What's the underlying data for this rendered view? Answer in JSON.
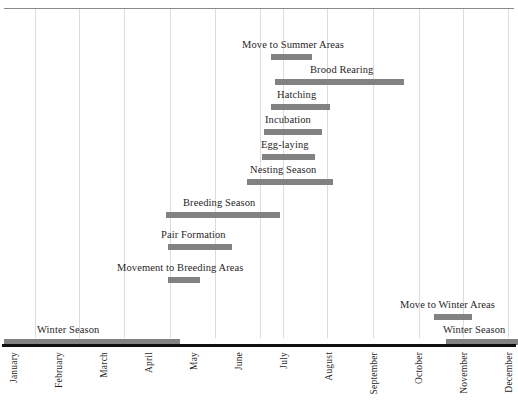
{
  "chart_data": {
    "type": "bar",
    "orientation": "horizontal-gantt",
    "title": "",
    "subtitle": "",
    "xlabel": "",
    "ylabel": "",
    "grid": true,
    "legend": null,
    "xlim": [
      1,
      13
    ],
    "x_unit": "month",
    "categories": [
      "January",
      "February",
      "March",
      "April",
      "May",
      "June",
      "July",
      "August",
      "September",
      "October",
      "November",
      "December"
    ],
    "tick_labels": [
      "January",
      "February",
      "March",
      "April",
      "May",
      "June",
      "July",
      "August",
      "September",
      "October",
      "November",
      "December"
    ],
    "bar_color": "#828282",
    "axis_color": "#101010",
    "grid_color": "#dcdcdc",
    "tasks": [
      {
        "label": "Move to Summer Areas",
        "start_month": 6.7,
        "end_month": 7.7,
        "start_px": 271,
        "end_px": 312,
        "row": 0,
        "label_align": "start-at-bar-start-offset",
        "label_px": 242
      },
      {
        "label": "Brood Rearing",
        "start_month": 6.8,
        "end_month": 9.9,
        "start_px": 275,
        "end_px": 404,
        "row": 1,
        "label_align": "end",
        "label_px": 310
      },
      {
        "label": "Hatching",
        "start_month": 6.7,
        "end_month": 8.1,
        "start_px": 271,
        "end_px": 330,
        "row": 2,
        "label_align": "center",
        "label_px": 277
      },
      {
        "label": "Incubation",
        "start_month": 6.5,
        "end_month": 7.9,
        "start_px": 264,
        "end_px": 322,
        "row": 3,
        "label_align": "center",
        "label_px": 265
      },
      {
        "label": "Egg-laying",
        "start_month": 6.4,
        "end_month": 7.7,
        "start_px": 262,
        "end_px": 315,
        "row": 4,
        "label_align": "center",
        "label_px": 261
      },
      {
        "label": "Nesting Season",
        "start_month": 6.1,
        "end_month": 8.2,
        "start_px": 247,
        "end_px": 333,
        "row": 5,
        "label_align": "center",
        "label_px": 250
      },
      {
        "label": "Breeding Season",
        "start_month": 4.2,
        "end_month": 6.9,
        "start_px": 166,
        "end_px": 280,
        "row": 6,
        "label_align": "center",
        "label_px": 183
      },
      {
        "label": "Pair Formation",
        "start_month": 4.2,
        "end_month": 5.8,
        "start_px": 168,
        "end_px": 232,
        "row": 7,
        "label_align": "center",
        "label_px": 161
      },
      {
        "label": "Movement to Breeding Areas",
        "start_month": 4.2,
        "end_month": 5.0,
        "start_px": 168,
        "end_px": 200,
        "row": 8,
        "label_align": "center",
        "label_px": 117
      },
      {
        "label": "Move to Winter Areas",
        "start_month": 10.6,
        "end_month": 11.5,
        "start_px": 434,
        "end_px": 472,
        "row": 9,
        "label_align": "center",
        "label_px": 400
      },
      {
        "label": "Winter Season",
        "start_month": 10.9,
        "end_month": 13.0,
        "start_px": 446,
        "end_px": 518,
        "row": 10,
        "label_align": "end",
        "label_px": 443
      },
      {
        "label": "Winter Season",
        "start_month": 1.0,
        "end_month": 5.2,
        "start_px": 4,
        "end_px": 180,
        "row": 10,
        "label_align": "center",
        "label_px": 37
      }
    ],
    "gridline_positions_px": [
      35,
      79,
      124,
      170,
      215,
      260,
      283,
      327,
      373,
      419,
      463,
      508
    ],
    "month_label_positions_px": [
      9,
      54,
      99,
      144,
      189,
      234,
      279,
      324,
      369,
      414,
      459,
      504
    ]
  }
}
